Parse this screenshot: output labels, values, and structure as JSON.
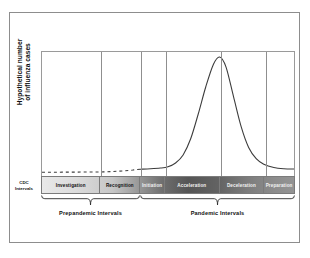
{
  "figure": {
    "y_axis_title_line1": "Hypothetical number",
    "y_axis_title_line2": "of influenza cases",
    "cdc_label_line1": "CDC",
    "cdc_label_line2": "Intervals"
  },
  "intervals": [
    {
      "label": "Investigation",
      "start": 0.0,
      "end": 0.232,
      "dark": false
    },
    {
      "label": "Recognition",
      "label_short": "Recognition",
      "start": 0.232,
      "end": 0.39,
      "dark": false
    },
    {
      "label": "Initiation",
      "start": 0.39,
      "end": 0.488,
      "dark": true
    },
    {
      "label": "Acceleration",
      "start": 0.488,
      "end": 0.705,
      "dark": true
    },
    {
      "label": "Deceleration",
      "start": 0.705,
      "end": 0.882,
      "dark": true
    },
    {
      "label": "Preparation",
      "start": 0.882,
      "end": 1.0,
      "dark": true
    }
  ],
  "groups": [
    {
      "label": "Prepandemic Intervals",
      "start": 0.0,
      "end": 0.39
    },
    {
      "label": "Pandemic Intervals",
      "start": 0.39,
      "end": 1.0
    }
  ],
  "colors": {
    "frame": "#8d8d8d",
    "plot_border": "#9a9a9a",
    "divider": "#8f8f8f",
    "curve": "#3c3c3c",
    "band_light": "#e9e9e9",
    "band_dark": "#555555",
    "text": "#111111"
  },
  "chart_data": {
    "type": "line",
    "title": "",
    "xlabel": "",
    "ylabel": "Hypothetical number of influenza cases",
    "xlim": [
      0,
      1
    ],
    "ylim": [
      0,
      1
    ],
    "grid": false,
    "legend": "none",
    "axis_ticks": [],
    "annotations": [
      "CDC Intervals",
      "Prepandemic Intervals",
      "Pandemic Intervals"
    ],
    "series": [
      {
        "name": "Hypothetical influenza cases (prepandemic, dashed)",
        "style": "dashed",
        "x": [
          0.0,
          0.04,
          0.08,
          0.12,
          0.16,
          0.2,
          0.24,
          0.28,
          0.32,
          0.36,
          0.39
        ],
        "y": [
          0.03,
          0.03,
          0.031,
          0.031,
          0.032,
          0.032,
          0.033,
          0.036,
          0.041,
          0.048,
          0.055
        ]
      },
      {
        "name": "Hypothetical influenza cases (pandemic, solid)",
        "style": "solid",
        "x": [
          0.39,
          0.43,
          0.47,
          0.5,
          0.53,
          0.56,
          0.59,
          0.62,
          0.65,
          0.68,
          0.705,
          0.73,
          0.76,
          0.79,
          0.82,
          0.85,
          0.88,
          0.92,
          0.96,
          1.0
        ],
        "y": [
          0.055,
          0.058,
          0.064,
          0.075,
          0.105,
          0.17,
          0.3,
          0.5,
          0.72,
          0.9,
          0.96,
          0.88,
          0.64,
          0.4,
          0.23,
          0.14,
          0.095,
          0.068,
          0.058,
          0.056
        ]
      }
    ],
    "peak": {
      "x": 0.705,
      "y": 0.96,
      "note": "Peak at Acceleration / Deceleration boundary"
    },
    "interval_boundaries": [
      0.232,
      0.39,
      0.488,
      0.705,
      0.882
    ],
    "categories": [
      "Investigation",
      "Recognition",
      "Initiation",
      "Acceleration",
      "Deceleration",
      "Preparation"
    ]
  }
}
